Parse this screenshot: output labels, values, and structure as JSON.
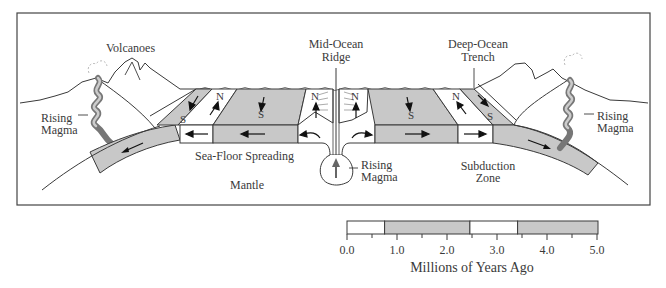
{
  "diagram": {
    "labels": {
      "volcanoes": "Volcanoes",
      "mid_ocean_ridge_1": "Mid-Ocean",
      "mid_ocean_ridge_2": "Ridge",
      "deep_ocean_trench_1": "Deep-Ocean",
      "deep_ocean_trench_2": "Trench",
      "rising_magma_left_1": "Rising",
      "rising_magma_left_2": "Magma",
      "rising_magma_right_1": "Rising",
      "rising_magma_right_2": "Magma",
      "rising_magma_center_1": "Rising",
      "rising_magma_center_2": "Magma",
      "sea_floor_spreading": "Sea-Floor Spreading",
      "mantle": "Mantle",
      "subduction_zone_1": "Subduction",
      "subduction_zone_2": "Zone"
    },
    "polarity": {
      "north": "N",
      "south": "S"
    },
    "colors": {
      "stripe_gray": "#c8c8c8",
      "stripe_white": "#ffffff",
      "magma": "#8c8c8c",
      "line": "#3a3a3a"
    }
  },
  "scale": {
    "title": "Millions of Years Ago",
    "ticks": [
      "0.0",
      "1.0",
      "2.0",
      "3.0",
      "4.0",
      "5.0"
    ],
    "segments": [
      {
        "from": 0.0,
        "to": 0.75,
        "polarity": "normal",
        "color": "white"
      },
      {
        "from": 0.75,
        "to": 2.45,
        "polarity": "reversed",
        "color": "gray"
      },
      {
        "from": 2.45,
        "to": 3.4,
        "polarity": "normal",
        "color": "white"
      },
      {
        "from": 3.4,
        "to": 5.0,
        "polarity": "reversed",
        "color": "gray"
      }
    ]
  }
}
